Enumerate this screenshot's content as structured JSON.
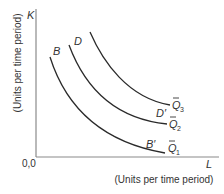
{
  "diagram": {
    "type": "isoquant-map",
    "axes": {
      "y_symbol": "K",
      "y_label": "(Units per time period)",
      "x_symbol": "L",
      "x_label": "(Units per time period)",
      "origin_label": "0,0"
    },
    "curves": [
      {
        "name": "Q1",
        "label_base": "Q",
        "label_sub": "1",
        "start_point": "B",
        "end_point": "B′"
      },
      {
        "name": "Q2",
        "label_base": "Q",
        "label_sub": "2",
        "start_point": "D",
        "end_point": "D′"
      },
      {
        "name": "Q3",
        "label_base": "Q",
        "label_sub": "3"
      }
    ],
    "colors": {
      "axis": "#8a8a8a",
      "curve": "#2a2a2a",
      "text": "#333333"
    }
  }
}
